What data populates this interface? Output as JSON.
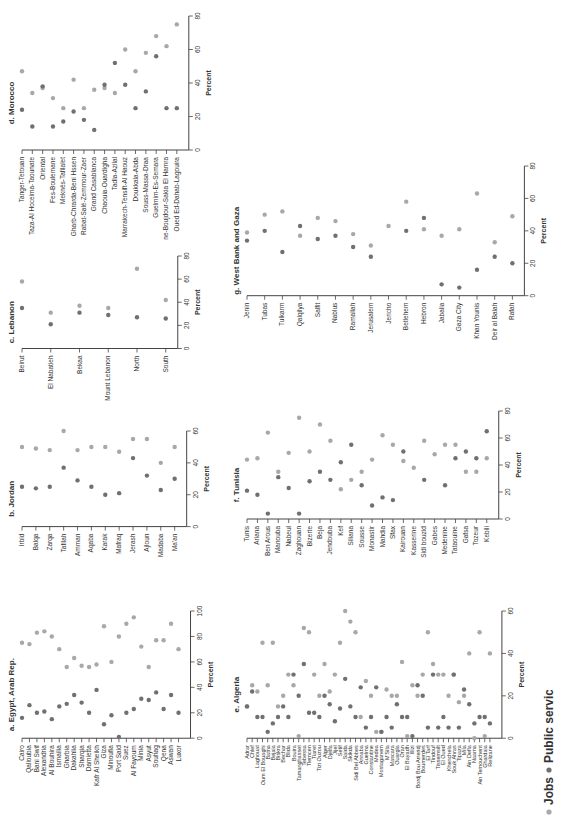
{
  "figure": {
    "orientation": "rotated-90",
    "legend": {
      "items": [
        {
          "label": "Jobs",
          "color": "#a8a8a8"
        },
        {
          "label": "Public services",
          "color": "#707070"
        }
      ]
    },
    "colors": {
      "jobs": "#a8a8a8",
      "public_services": "#707070",
      "axis": "#444444",
      "text": "#333333"
    }
  },
  "chart_data": [
    {
      "id": "a",
      "type": "scatter",
      "title": "a. Egypt, Arab Rep.",
      "ylabel": "Percent",
      "ylim": [
        0,
        100
      ],
      "yticks": [
        0,
        20,
        40,
        60,
        80,
        100
      ],
      "categories": [
        "Cairo",
        "Qalioubia",
        "Bani Swif",
        "Alexandria",
        "Al Bouhira",
        "Ismailia",
        "Gharbia",
        "Dakahlia",
        "Sharqia",
        "Damietta",
        "Kafr Al Sheikh",
        "Giza",
        "Minoufia",
        "Port Said",
        "Suez",
        "Al Fayoum",
        "Minia",
        "Asyut",
        "Souhag",
        "Qena",
        "Aswan",
        "Luxor"
      ],
      "series": [
        {
          "name": "Jobs",
          "values": [
            75,
            74,
            83,
            84,
            80,
            70,
            56,
            63,
            57,
            56,
            58,
            88,
            60,
            80,
            90,
            95,
            72,
            56,
            77,
            77,
            90,
            70
          ]
        },
        {
          "name": "Public services",
          "values": [
            16,
            26,
            20,
            21,
            15,
            25,
            27,
            34,
            28,
            20,
            38,
            11,
            18,
            1,
            20,
            23,
            31,
            30,
            36,
            23,
            34,
            20
          ]
        }
      ]
    },
    {
      "id": "b",
      "type": "scatter",
      "title": "b. Jordan",
      "ylabel": "Percent",
      "ylim": [
        0,
        60
      ],
      "yticks": [
        0,
        20,
        40,
        60
      ],
      "categories": [
        "Irbid",
        "Balqa",
        "Zarqa",
        "Tafilah",
        "Amman",
        "Aqaba",
        "Karak",
        "Mafraq",
        "Jerash",
        "Ajloun",
        "Madaba",
        "Ma'an"
      ],
      "series": [
        {
          "name": "Jobs",
          "values": [
            50,
            49,
            48,
            60,
            48,
            50,
            50,
            47,
            55,
            55,
            40,
            50
          ]
        },
        {
          "name": "Public services",
          "values": [
            25,
            24,
            25,
            37,
            29,
            25,
            20,
            21,
            43,
            32,
            23,
            30
          ]
        }
      ]
    },
    {
      "id": "c",
      "type": "scatter",
      "title": "c. Lebanon",
      "ylabel": "Percent",
      "ylim": [
        0,
        80
      ],
      "yticks": [
        0,
        20,
        40,
        60,
        80
      ],
      "categories": [
        "Beirut",
        "El Nabatieh",
        "Bekaa",
        "Mount Lebanon",
        "North",
        "South"
      ],
      "series": [
        {
          "name": "Jobs",
          "values": [
            58,
            31,
            37,
            35,
            69,
            42
          ]
        },
        {
          "name": "Public services",
          "values": [
            35,
            21,
            31,
            29,
            27,
            26
          ]
        }
      ]
    },
    {
      "id": "d",
      "type": "scatter",
      "title": "d. Morocco",
      "ylabel": "Percent",
      "ylim": [
        0,
        80
      ],
      "yticks": [
        0,
        20,
        40,
        60,
        80
      ],
      "categories": [
        "Tanger-Tetouan",
        "Taza-Al Hoceima-Taounate",
        "Oriental",
        "Fes-Boulemane",
        "Meknès-Tafilalet",
        "Gharb-Chrarda-Beni Hssen",
        "Rabat-Salé-Zemmour-Zaer",
        "Grand Casablanca",
        "Chaouia-Ouardigha",
        "Tadla-Azilal",
        "Marrakech-Tensift-Al Haouz",
        "Doukkala-Abda",
        "Souss-Massa-Draa",
        "Guelmim-Es-Semara",
        "Laayoune-Boujdour-Sakia El Hamra",
        "Oued Ed-Dahab-Lagouira"
      ],
      "series": [
        {
          "name": "Jobs",
          "values": [
            47,
            34,
            37,
            31,
            25,
            42,
            25,
            36,
            37,
            34,
            60,
            47,
            58,
            68,
            62,
            75
          ]
        },
        {
          "name": "Public services",
          "values": [
            24,
            14,
            38,
            14,
            17,
            23,
            18,
            12,
            39,
            52,
            39,
            25,
            35,
            56,
            25,
            25
          ]
        }
      ]
    },
    {
      "id": "e",
      "type": "scatter",
      "title": "e. Algeria",
      "ylabel": "Percent",
      "ylim": [
        0,
        60
      ],
      "yticks": [
        0,
        20,
        40,
        60
      ],
      "categories": [
        "Adrar",
        "Chlef",
        "Laghouat",
        "Oum El Bouaghi",
        "Batna",
        "Bejaia",
        "Biskra",
        "Bechar",
        "Blida",
        "Bouira",
        "Tamanghasset",
        "Tebessa",
        "Tlemcen",
        "Tiaret",
        "Tizi Ouzou",
        "Alger",
        "Djelfa",
        "Jijel",
        "Setif",
        "Saida",
        "Skikda",
        "Sidi Bel Abbes",
        "Annaba",
        "Guelma",
        "Constantine",
        "Medea",
        "Mostaganem",
        "M'Sila",
        "Mascara",
        "Ouargla",
        "Oran",
        "El Bayadh",
        "Illizi",
        "Bordj Bou Arreridj",
        "Boumerdes",
        "El Tarf",
        "Tindouf",
        "Tissemsilt",
        "El Oued",
        "Khenchela",
        "Souk Ahras",
        "Tipaza",
        "Mila",
        "Ain Defla",
        "Naama",
        "Ain Temouchent",
        "Ghardaia",
        "Relizane"
      ],
      "series": [
        {
          "name": "Jobs",
          "values": [
            15,
            25,
            22,
            45,
            25,
            45,
            15,
            20,
            30,
            25,
            1,
            52,
            50,
            30,
            20,
            35,
            22,
            30,
            45,
            60,
            55,
            50,
            10,
            27,
            20,
            3,
            3,
            23,
            20,
            20,
            36,
            1,
            25,
            20,
            30,
            50,
            35,
            30,
            30,
            20,
            30,
            17,
            20,
            40,
            0,
            50,
            1,
            40
          ]
        },
        {
          "name": "Public services",
          "values": [
            15,
            22,
            10,
            10,
            3,
            7,
            10,
            15,
            10,
            30,
            20,
            35,
            12,
            12,
            10,
            20,
            16,
            8,
            14,
            28,
            15,
            10,
            24,
            5,
            10,
            24,
            3,
            10,
            5,
            16,
            10,
            10,
            1,
            25,
            20,
            5,
            30,
            5,
            10,
            5,
            30,
            5,
            23,
            16,
            7,
            10,
            10,
            7
          ]
        }
      ]
    },
    {
      "id": "f",
      "type": "scatter",
      "title": "f. Tunisia",
      "ylabel": "Percent",
      "ylim": [
        0,
        80
      ],
      "yticks": [
        0,
        20,
        40,
        60,
        80
      ],
      "categories": [
        "Tunis",
        "Ariana",
        "Ben Arous",
        "Manouba",
        "Nabeul",
        "Zaghouan",
        "Bizerte",
        "Beja",
        "Jendouba",
        "Kef",
        "Siliana",
        "Sousse",
        "Monastir",
        "Mahdia",
        "Sfax",
        "Kairouan",
        "Kasserine",
        "Sidi bouzid",
        "Gabes",
        "Medenine",
        "Tataouine",
        "Gafsa",
        "Tozeur",
        "Kebili"
      ],
      "series": [
        {
          "name": "Jobs",
          "values": [
            44,
            45,
            64,
            35,
            49,
            75,
            50,
            70,
            58,
            22,
            29,
            35,
            44,
            62,
            55,
            43,
            38,
            58,
            48,
            55,
            55,
            35,
            35,
            45
          ]
        },
        {
          "name": "Public services",
          "values": [
            21,
            18,
            4,
            31,
            23,
            4,
            28,
            35,
            29,
            42,
            55,
            25,
            10,
            16,
            14,
            50,
            null,
            29,
            null,
            25,
            45,
            50,
            45,
            65
          ]
        }
      ]
    },
    {
      "id": "g",
      "type": "scatter",
      "title": "g. West Bank and Gaza",
      "ylabel": "Percent",
      "ylim": [
        0,
        80
      ],
      "yticks": [
        0,
        20,
        40,
        60,
        80
      ],
      "categories": [
        "Jenin",
        "Tubas",
        "Tulkarm",
        "Qalqilya",
        "Salfit",
        "Nablus",
        "Ramallah",
        "Jerusalem",
        "Jericho",
        "Betlehem",
        "Hebron",
        "Jabalia",
        "Gaza City",
        "Khan Younis",
        "Deir al Balah",
        "Rafah"
      ],
      "series": [
        {
          "name": "Jobs",
          "values": [
            39,
            50,
            52,
            37,
            48,
            46,
            38,
            31,
            43,
            58,
            41,
            37,
            41,
            63,
            33,
            49
          ]
        },
        {
          "name": "Public services",
          "values": [
            34,
            40,
            27,
            43,
            35,
            37,
            30,
            24,
            null,
            40,
            48,
            7,
            5,
            16,
            24,
            20
          ]
        }
      ]
    }
  ]
}
